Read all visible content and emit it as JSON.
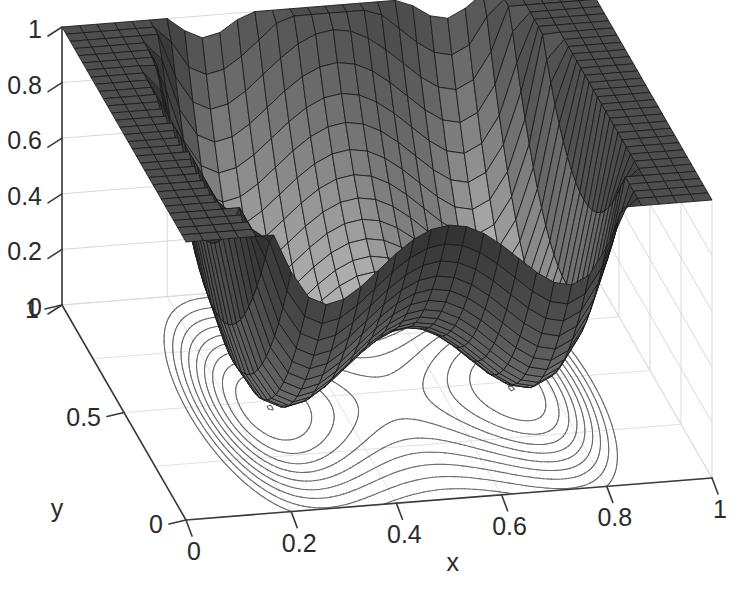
{
  "figure": {
    "kind": "3d-mesh-contour-surface-plot",
    "background_color": "#ffffff",
    "mesh_line_color": "#1a1a1a",
    "contour_line_color": "#6a6a6a",
    "axis_color": "#3a3a3a",
    "grid_color": "#d8d8d8",
    "text_color": "#2b2b2b"
  },
  "chart_data": {
    "type": "surface",
    "render": "mesh-with-contour",
    "title": "",
    "xlabel": "x",
    "ylabel": "y",
    "zlabel": "",
    "xlim": [
      0,
      1
    ],
    "ylim": [
      0,
      1
    ],
    "zlim": [
      0,
      1
    ],
    "grid": true,
    "legend": "none",
    "colormap": "gray",
    "mesh_n": 30,
    "view_azimuth_deg": -37.5,
    "view_elevation_deg": 30,
    "surface_formula": "z = clamp( 0.30*((2*((x-0.5)^2) - 0.115)^2)/0.0132 + 3.1*(y-0.47)^2 + 0.9*(x-0.5)^2 , 0, 1 )",
    "surface_minima": [
      {
        "x": 0.27,
        "y": 0.46,
        "z": 0.0
      },
      {
        "x": 0.73,
        "y": 0.46,
        "z": 0.0
      }
    ],
    "surface_saddle": {
      "x": 0.5,
      "y": 0.46,
      "z": 0.33
    },
    "contour_levels": [
      0.05,
      0.12,
      0.19,
      0.26,
      0.33,
      0.41,
      0.5,
      0.6,
      0.72,
      0.86
    ],
    "x_ticks": [
      {
        "value": 0,
        "label": "0"
      },
      {
        "value": 0.2,
        "label": "0.2"
      },
      {
        "value": 0.4,
        "label": "0.4"
      },
      {
        "value": 0.6,
        "label": "0.6"
      },
      {
        "value": 0.8,
        "label": "0.8"
      },
      {
        "value": 1,
        "label": "1"
      }
    ],
    "y_ticks": [
      {
        "value": 0,
        "label": "0"
      },
      {
        "value": 0.5,
        "label": "0.5"
      },
      {
        "value": 1,
        "label": "1"
      }
    ],
    "z_ticks": [
      {
        "value": 0,
        "label": "0"
      },
      {
        "value": 0.2,
        "label": "0.2"
      },
      {
        "value": 0.4,
        "label": "0.4"
      },
      {
        "value": 0.6,
        "label": "0.6"
      },
      {
        "value": 0.8,
        "label": "0.8"
      },
      {
        "value": 1,
        "label": "1"
      }
    ]
  },
  "axes": {
    "x_title": "x",
    "y_title": "y"
  }
}
